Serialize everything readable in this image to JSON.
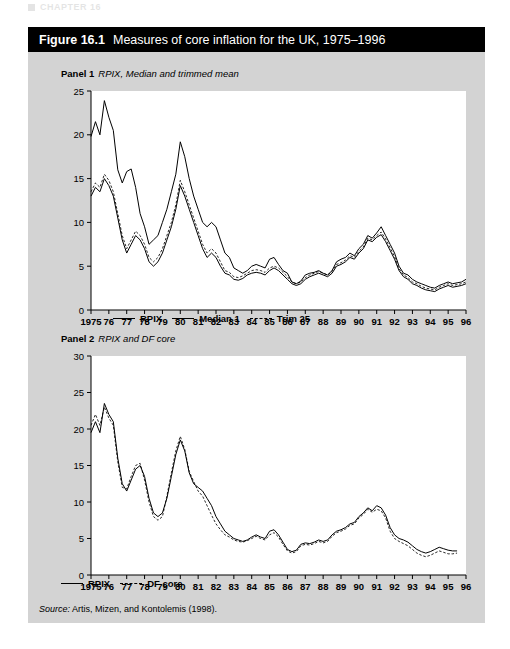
{
  "running_header": "CHAPTER 16",
  "figure": {
    "number": "Figure 16.1",
    "title": "Measures of core inflation for the UK, 1975–1996",
    "source": "Source:",
    "source_text": " Artis, Mizen, and Kontolemis (1998)."
  },
  "panel1": {
    "label_bold": "Panel 1",
    "label_italic": "RPIX, Median and trimmed mean"
  },
  "panel2": {
    "label_bold": "Panel 2",
    "label_italic": "RPIX and DF core"
  },
  "chart_data": [
    {
      "type": "line",
      "title": "Panel 1  RPIX, Median and trimmed mean",
      "xlabel": "",
      "ylabel": "",
      "ylim": [
        0,
        25
      ],
      "yticks": [
        0,
        5,
        10,
        15,
        20,
        25
      ],
      "xlim": [
        1975,
        1996
      ],
      "xticks": [
        1975,
        1976,
        1977,
        1978,
        1979,
        1980,
        1981,
        1982,
        1983,
        1984,
        1985,
        1986,
        1987,
        1988,
        1989,
        1990,
        1991,
        1992,
        1993,
        1994,
        1995,
        1996
      ],
      "xticklabels": [
        "1975",
        "76",
        "77",
        "78",
        "79",
        "80",
        "81",
        "82",
        "83",
        "84",
        "85",
        "86",
        "87",
        "88",
        "89",
        "90",
        "91",
        "92",
        "93",
        "94",
        "95",
        "96"
      ],
      "grid": false,
      "legend_position": "below",
      "series": [
        {
          "name": "RPIX",
          "style": "solid",
          "x": [
            1975.0,
            1975.25,
            1975.5,
            1975.75,
            1976.0,
            1976.25,
            1976.5,
            1976.75,
            1977.0,
            1977.25,
            1977.5,
            1977.75,
            1978.0,
            1978.25,
            1978.5,
            1978.75,
            1979.0,
            1979.25,
            1979.5,
            1979.75,
            1980.0,
            1980.25,
            1980.5,
            1980.75,
            1981.0,
            1981.25,
            1981.5,
            1981.75,
            1982.0,
            1982.25,
            1982.5,
            1982.75,
            1983.0,
            1983.25,
            1983.5,
            1983.75,
            1984.0,
            1984.25,
            1984.5,
            1984.75,
            1985.0,
            1985.25,
            1985.5,
            1985.75,
            1986.0,
            1986.25,
            1986.5,
            1986.75,
            1987.0,
            1987.25,
            1987.5,
            1987.75,
            1988.0,
            1988.25,
            1988.5,
            1988.75,
            1989.0,
            1989.25,
            1989.5,
            1989.75,
            1990.0,
            1990.25,
            1990.5,
            1990.75,
            1991.0,
            1991.25,
            1991.5,
            1991.75,
            1992.0,
            1992.25,
            1992.5,
            1992.75,
            1993.0,
            1993.25,
            1993.5,
            1993.75,
            1994.0,
            1994.25,
            1994.5,
            1994.75,
            1995.0,
            1995.25,
            1995.5,
            1995.75,
            1996.0
          ],
          "values": [
            19.8,
            21.5,
            20.0,
            23.9,
            22.0,
            20.5,
            16.0,
            14.5,
            15.8,
            16.1,
            14.0,
            11.0,
            9.5,
            7.5,
            8.0,
            8.5,
            10.0,
            11.5,
            13.5,
            15.5,
            19.2,
            17.5,
            15.0,
            13.0,
            11.5,
            10.0,
            9.5,
            10.0,
            9.5,
            8.0,
            6.5,
            6.0,
            4.8,
            4.5,
            4.2,
            4.5,
            5.0,
            5.2,
            5.0,
            4.8,
            5.8,
            6.0,
            5.2,
            4.5,
            4.2,
            3.2,
            3.0,
            3.3,
            4.0,
            4.2,
            4.3,
            4.5,
            4.2,
            4.0,
            4.5,
            5.5,
            5.8,
            6.0,
            6.5,
            6.2,
            7.0,
            7.5,
            8.5,
            8.2,
            8.8,
            9.5,
            8.5,
            7.5,
            6.5,
            5.0,
            4.2,
            4.0,
            3.5,
            3.2,
            3.0,
            2.8,
            2.6,
            2.5,
            2.8,
            3.0,
            3.2,
            3.0,
            3.1,
            3.2,
            3.5
          ]
        },
        {
          "name": "Median 1",
          "style": "solid",
          "x": [
            1975.0,
            1975.25,
            1975.5,
            1975.75,
            1976.0,
            1976.25,
            1976.5,
            1976.75,
            1977.0,
            1977.25,
            1977.5,
            1977.75,
            1978.0,
            1978.25,
            1978.5,
            1978.75,
            1979.0,
            1979.25,
            1979.5,
            1979.75,
            1980.0,
            1980.25,
            1980.5,
            1980.75,
            1981.0,
            1981.25,
            1981.5,
            1981.75,
            1982.0,
            1982.25,
            1982.5,
            1982.75,
            1983.0,
            1983.25,
            1983.5,
            1983.75,
            1984.0,
            1984.25,
            1984.5,
            1984.75,
            1985.0,
            1985.25,
            1985.5,
            1985.75,
            1986.0,
            1986.25,
            1986.5,
            1986.75,
            1987.0,
            1987.25,
            1987.5,
            1987.75,
            1988.0,
            1988.25,
            1988.5,
            1988.75,
            1989.0,
            1989.25,
            1989.5,
            1989.75,
            1990.0,
            1990.25,
            1990.5,
            1990.75,
            1991.0,
            1991.25,
            1991.5,
            1991.75,
            1992.0,
            1992.25,
            1992.5,
            1992.75,
            1993.0,
            1993.25,
            1993.5,
            1993.75,
            1994.0,
            1994.25,
            1994.5,
            1994.75,
            1995.0,
            1995.25,
            1995.5,
            1995.75,
            1996.0
          ],
          "values": [
            13.0,
            14.0,
            13.5,
            15.0,
            14.2,
            13.0,
            10.5,
            8.0,
            6.5,
            7.5,
            8.5,
            8.0,
            7.0,
            5.5,
            5.0,
            5.5,
            6.5,
            8.0,
            9.5,
            11.5,
            14.2,
            13.0,
            11.5,
            10.0,
            8.5,
            7.0,
            6.0,
            6.5,
            6.0,
            5.0,
            4.2,
            4.0,
            3.5,
            3.4,
            3.6,
            4.0,
            4.2,
            4.3,
            4.2,
            4.0,
            4.5,
            4.8,
            4.5,
            4.0,
            3.5,
            3.0,
            2.8,
            3.0,
            3.5,
            3.8,
            4.0,
            4.2,
            4.0,
            3.8,
            4.2,
            5.0,
            5.2,
            5.5,
            6.0,
            5.8,
            6.5,
            7.0,
            8.0,
            7.8,
            8.3,
            8.6,
            7.8,
            6.8,
            5.8,
            4.5,
            3.8,
            3.5,
            3.0,
            2.8,
            2.5,
            2.3,
            2.2,
            2.1,
            2.4,
            2.6,
            2.8,
            2.6,
            2.7,
            2.8,
            3.0
          ]
        },
        {
          "name": "Trim 25",
          "style": "dotted",
          "x": [
            1975.0,
            1975.25,
            1975.5,
            1975.75,
            1976.0,
            1976.25,
            1976.5,
            1976.75,
            1977.0,
            1977.25,
            1977.5,
            1977.75,
            1978.0,
            1978.25,
            1978.5,
            1978.75,
            1979.0,
            1979.25,
            1979.5,
            1979.75,
            1980.0,
            1980.25,
            1980.5,
            1980.75,
            1981.0,
            1981.25,
            1981.5,
            1981.75,
            1982.0,
            1982.25,
            1982.5,
            1982.75,
            1983.0,
            1983.25,
            1983.5,
            1983.75,
            1984.0,
            1984.25,
            1984.5,
            1984.75,
            1985.0,
            1985.25,
            1985.5,
            1985.75,
            1986.0,
            1986.25,
            1986.5,
            1986.75,
            1987.0,
            1987.25,
            1987.5,
            1987.75,
            1988.0,
            1988.25,
            1988.5,
            1988.75,
            1989.0,
            1989.25,
            1989.5,
            1989.75,
            1990.0,
            1990.25,
            1990.5,
            1990.75,
            1991.0,
            1991.25,
            1991.5,
            1991.75,
            1992.0,
            1992.25,
            1992.5,
            1992.75,
            1993.0,
            1993.25,
            1993.5,
            1993.75,
            1994.0,
            1994.25,
            1994.5,
            1994.75,
            1995.0,
            1995.25,
            1995.5,
            1995.75,
            1996.0
          ],
          "values": [
            13.5,
            14.5,
            14.0,
            15.5,
            14.8,
            13.5,
            11.0,
            8.5,
            7.0,
            8.0,
            9.0,
            8.5,
            7.5,
            6.0,
            5.5,
            6.0,
            7.0,
            8.5,
            10.0,
            12.0,
            14.8,
            13.5,
            12.0,
            10.5,
            9.0,
            7.5,
            6.5,
            7.0,
            6.5,
            5.5,
            4.5,
            4.3,
            3.8,
            3.7,
            3.9,
            4.2,
            4.5,
            4.6,
            4.5,
            4.3,
            4.8,
            5.0,
            4.8,
            4.3,
            3.8,
            3.2,
            3.0,
            3.2,
            3.7,
            4.0,
            4.2,
            4.4,
            4.2,
            4.0,
            4.4,
            5.2,
            5.4,
            5.7,
            6.2,
            6.0,
            6.7,
            7.2,
            8.2,
            8.0,
            8.5,
            8.9,
            8.1,
            7.1,
            6.1,
            4.7,
            4.0,
            3.7,
            3.2,
            3.0,
            2.7,
            2.5,
            2.4,
            2.3,
            2.6,
            2.8,
            3.0,
            2.8,
            2.9,
            3.0,
            3.2
          ]
        }
      ]
    },
    {
      "type": "line",
      "title": "Panel 2  RPIX and DF core",
      "xlabel": "",
      "ylabel": "",
      "ylim": [
        0,
        30
      ],
      "yticks": [
        0,
        5,
        10,
        15,
        20,
        25,
        30
      ],
      "xlim": [
        1975,
        1996
      ],
      "xticks": [
        1975,
        1976,
        1977,
        1978,
        1979,
        1980,
        1981,
        1982,
        1983,
        1984,
        1985,
        1986,
        1987,
        1988,
        1989,
        1990,
        1991,
        1992,
        1993,
        1994,
        1995,
        1996
      ],
      "xticklabels": [
        "1975",
        "76",
        "77",
        "78",
        "79",
        "80",
        "81",
        "82",
        "83",
        "84",
        "85",
        "86",
        "87",
        "88",
        "89",
        "90",
        "91",
        "92",
        "93",
        "94",
        "95",
        "96"
      ],
      "grid": false,
      "legend_position": "below",
      "series": [
        {
          "name": "RPIX",
          "style": "solid",
          "x": [
            1975.0,
            1975.25,
            1975.5,
            1975.75,
            1976.0,
            1976.25,
            1976.5,
            1976.75,
            1977.0,
            1977.25,
            1977.5,
            1977.75,
            1978.0,
            1978.25,
            1978.5,
            1978.75,
            1979.0,
            1979.25,
            1979.5,
            1979.75,
            1980.0,
            1980.25,
            1980.5,
            1980.75,
            1981.0,
            1981.25,
            1981.5,
            1981.75,
            1982.0,
            1982.25,
            1982.5,
            1982.75,
            1983.0,
            1983.25,
            1983.5,
            1983.75,
            1984.0,
            1984.25,
            1984.5,
            1984.75,
            1985.0,
            1985.25,
            1985.5,
            1985.75,
            1986.0,
            1986.25,
            1986.5,
            1986.75,
            1987.0,
            1987.25,
            1987.5,
            1987.75,
            1988.0,
            1988.25,
            1988.5,
            1988.75,
            1989.0,
            1989.25,
            1989.5,
            1989.75,
            1990.0,
            1990.25,
            1990.5,
            1990.75,
            1991.0,
            1991.25,
            1991.5,
            1991.75,
            1992.0,
            1992.25,
            1992.5,
            1992.75,
            1993.0,
            1993.25,
            1993.5,
            1993.75,
            1994.0,
            1994.25,
            1994.5,
            1994.75,
            1995.0,
            1995.25,
            1995.5,
            1995.75,
            1996.0
          ],
          "values": [
            19.5,
            21.0,
            19.5,
            23.5,
            22.0,
            21.0,
            16.0,
            12.5,
            11.5,
            13.0,
            14.5,
            15.0,
            13.5,
            10.5,
            8.5,
            8.0,
            8.5,
            10.5,
            13.5,
            16.5,
            18.5,
            17.0,
            14.0,
            12.5,
            12.0,
            11.5,
            10.5,
            9.5,
            8.0,
            7.0,
            6.0,
            5.5,
            5.0,
            4.8,
            4.6,
            4.8,
            5.2,
            5.5,
            5.2,
            5.0,
            6.0,
            6.2,
            5.5,
            4.5,
            3.5,
            3.2,
            3.4,
            4.2,
            4.4,
            4.3,
            4.5,
            4.8,
            4.6,
            4.8,
            5.5,
            6.0,
            6.2,
            6.5,
            7.0,
            7.2,
            8.0,
            8.5,
            9.2,
            8.8,
            9.5,
            9.2,
            8.2,
            6.5,
            5.5,
            5.0,
            4.8,
            4.5,
            4.0,
            3.5,
            3.2,
            3.0,
            3.2,
            3.5,
            3.8,
            3.6,
            3.4,
            3.3,
            3.3
          ]
        },
        {
          "name": "DF core",
          "style": "dotted",
          "x": [
            1975.0,
            1975.25,
            1975.5,
            1975.75,
            1976.0,
            1976.25,
            1976.5,
            1976.75,
            1977.0,
            1977.25,
            1977.5,
            1977.75,
            1978.0,
            1978.25,
            1978.5,
            1978.75,
            1979.0,
            1979.25,
            1979.5,
            1979.75,
            1980.0,
            1980.25,
            1980.5,
            1980.75,
            1981.0,
            1981.25,
            1981.5,
            1981.75,
            1982.0,
            1982.25,
            1982.5,
            1982.75,
            1983.0,
            1983.25,
            1983.5,
            1983.75,
            1984.0,
            1984.25,
            1984.5,
            1984.75,
            1985.0,
            1985.25,
            1985.5,
            1985.75,
            1986.0,
            1986.25,
            1986.5,
            1986.75,
            1987.0,
            1987.25,
            1987.5,
            1987.75,
            1988.0,
            1988.25,
            1988.5,
            1988.75,
            1989.0,
            1989.25,
            1989.5,
            1989.75,
            1990.0,
            1990.25,
            1990.5,
            1990.75,
            1991.0,
            1991.25,
            1991.5,
            1991.75,
            1992.0,
            1992.25,
            1992.5,
            1992.75,
            1993.0,
            1993.25,
            1993.5,
            1993.75,
            1994.0,
            1994.25,
            1994.5,
            1994.75,
            1995.0,
            1995.25,
            1995.5,
            1995.75,
            1996.0
          ],
          "values": [
            20.5,
            22.0,
            20.5,
            23.0,
            21.5,
            20.5,
            15.5,
            12.0,
            11.8,
            13.5,
            15.0,
            15.3,
            13.0,
            10.0,
            8.0,
            7.5,
            8.0,
            10.8,
            14.0,
            17.0,
            19.0,
            17.2,
            14.2,
            12.8,
            11.5,
            10.8,
            9.5,
            8.2,
            7.0,
            6.2,
            5.5,
            5.2,
            4.8,
            4.6,
            4.5,
            4.7,
            5.0,
            5.3,
            5.0,
            4.8,
            5.5,
            5.8,
            5.2,
            4.2,
            3.3,
            3.0,
            3.2,
            4.0,
            4.2,
            4.1,
            4.3,
            4.6,
            4.4,
            4.6,
            5.3,
            5.8,
            6.0,
            6.3,
            6.8,
            7.0,
            7.8,
            8.3,
            9.0,
            8.6,
            9.0,
            8.8,
            7.8,
            6.0,
            5.0,
            4.6,
            4.3,
            4.0,
            3.5,
            3.0,
            2.7,
            2.5,
            2.7,
            3.0,
            3.3,
            3.1,
            2.9,
            2.9,
            3.0
          ]
        }
      ]
    }
  ]
}
